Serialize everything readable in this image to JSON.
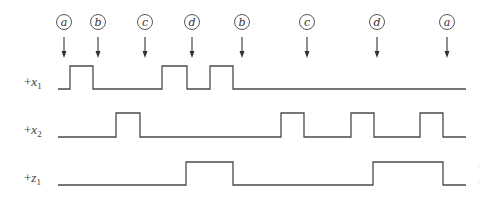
{
  "diagram": {
    "type": "timing-diagram",
    "markers": [
      {
        "label": "a",
        "x": 64
      },
      {
        "label": "b",
        "x": 98
      },
      {
        "label": "c",
        "x": 145
      },
      {
        "label": "d",
        "x": 192
      },
      {
        "label": "b",
        "x": 242
      },
      {
        "label": "c",
        "x": 307
      },
      {
        "label": "d",
        "x": 377
      },
      {
        "label": "a",
        "x": 447
      }
    ],
    "signals": [
      {
        "name": "x1",
        "prefix": "+",
        "var": "x",
        "sub": "1",
        "high_y": 66,
        "low_y": 89,
        "start_x": 58,
        "end_x": 466,
        "pulses": [
          [
            70,
            93
          ],
          [
            162,
            187
          ],
          [
            210,
            233
          ]
        ]
      },
      {
        "name": "x2",
        "prefix": "+",
        "var": "x",
        "sub": "2",
        "high_y": 113,
        "low_y": 137,
        "start_x": 58,
        "end_x": 466,
        "pulses": [
          [
            116,
            140
          ],
          [
            281,
            304
          ],
          [
            351,
            374
          ],
          [
            420,
            443
          ]
        ]
      },
      {
        "name": "z1",
        "prefix": "+",
        "var": "z",
        "sub": "1",
        "high_y": 162,
        "low_y": 185,
        "start_x": 58,
        "end_x": 466,
        "pulses": [
          [
            186,
            233
          ],
          [
            373,
            443
          ]
        ]
      }
    ]
  }
}
